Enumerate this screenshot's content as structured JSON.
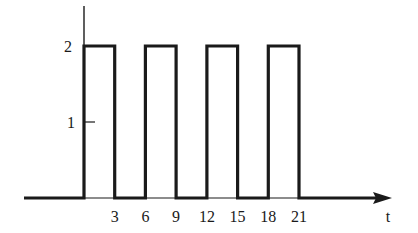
{
  "chart_data": {
    "type": "line",
    "title": "",
    "xlabel": "t",
    "ylabel": "",
    "x_ticks": [
      3,
      6,
      9,
      12,
      15,
      18,
      21
    ],
    "y_ticks": [
      1,
      2
    ],
    "xlim": [
      -5.5,
      28.5
    ],
    "ylim": [
      0,
      2.5
    ],
    "grid": false,
    "legend": null,
    "series": [
      {
        "name": "pulse train",
        "x": [
          -5.5,
          0,
          0,
          3,
          3,
          6,
          6,
          9,
          9,
          12,
          12,
          15,
          15,
          18,
          18,
          21,
          21,
          27.5
        ],
        "y": [
          0,
          0,
          2,
          2,
          0,
          0,
          2,
          2,
          0,
          0,
          2,
          2,
          0,
          0,
          2,
          2,
          0,
          0
        ]
      }
    ],
    "pulses": [
      {
        "start": 0,
        "end": 3,
        "height": 2
      },
      {
        "start": 6,
        "end": 9,
        "height": 2
      },
      {
        "start": 12,
        "end": 15,
        "height": 2
      },
      {
        "start": 18,
        "end": 21,
        "height": 2
      }
    ]
  },
  "labels": {
    "y_tick_1": "1",
    "y_tick_2": "2",
    "x_ticks": [
      "3",
      "6",
      "9",
      "12",
      "15",
      "18",
      "21"
    ],
    "x_axis": "t"
  }
}
